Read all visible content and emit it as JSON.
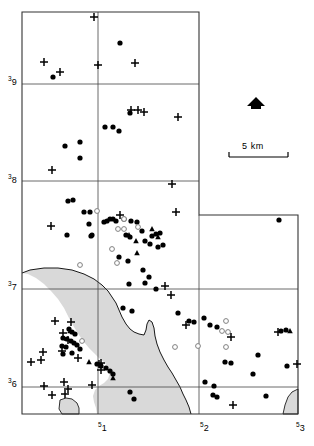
{
  "figure": {
    "type": "distribution-map",
    "width": 314,
    "height": 446,
    "background_color": "#ffffff",
    "line_color": "#000000",
    "shaded_area_color": "#d9d9d9"
  },
  "axes": {
    "x_labels": [
      {
        "text": "51",
        "sup": "5",
        "base": "1",
        "x": 98,
        "y": 424
      },
      {
        "text": "52",
        "sup": "5",
        "base": "2",
        "x": 200,
        "y": 424
      },
      {
        "text": "53",
        "sup": "5",
        "base": "3",
        "x": 296,
        "y": 424
      }
    ],
    "y_labels": [
      {
        "text": "39",
        "sup": "3",
        "base": "9",
        "x": 8,
        "y": 78
      },
      {
        "text": "38",
        "sup": "3",
        "base": "8",
        "x": 8,
        "y": 176
      },
      {
        "text": "37",
        "sup": "3",
        "base": "7",
        "x": 8,
        "y": 283
      },
      {
        "text": "36",
        "sup": "3",
        "base": "6",
        "x": 8,
        "y": 380
      }
    ]
  },
  "scale_bar": {
    "label": "5 km",
    "label_x": 242,
    "label_y": 141,
    "line_x1": 229,
    "line_x2": 288,
    "line_y": 157,
    "tick_height": 5
  },
  "north_arrow": {
    "name": "north-arrow",
    "cx": 256,
    "cy": 104
  },
  "frame": {
    "outer_path": "M22,12 L199,12 L199,215 L298,215 L298,414 L22,414 Z",
    "grid_lines": [
      {
        "orientation": "vertical",
        "x": 98,
        "y1": 12,
        "y2": 414
      },
      {
        "orientation": "horizontal",
        "y": 84,
        "x1": 22,
        "x2": 199
      },
      {
        "orientation": "horizontal",
        "y": 181,
        "x1": 22,
        "x2": 199
      },
      {
        "orientation": "horizontal",
        "y": 289,
        "x1": 22,
        "x2": 298
      },
      {
        "orientation": "horizontal",
        "y": 387,
        "x1": 22,
        "x2": 298
      },
      {
        "orientation": "vertical",
        "x": 199,
        "y1": 215,
        "y2": 414
      }
    ]
  },
  "shaded_region": {
    "name": "shaded-landform-region",
    "outline_path": "M22,273 L30,270 L44,268 L58,268 L72,270 L84,274 L94,279 L102,285 L108,291 L112,297 L116,303 L119,310 L122,317 L126,324 L130,329 L134,332 L139,334 L144,335 L146,330 L147,324 L149,320 L152,322 L154,328 L155,336 L157,344 L160,352 L164,360 L168,367 L172,373 L176,380 L180,387 L183,394 L186,400 L189,407 L191,414 L97,414 L96,408 L94,402 L93,396 L95,390 L99,386 L104,383 L108,379 L110,373 L108,367 L104,362 L99,358 L94,353 L89,348 L84,342 L79,335 L74,327 L69,318 L64,308 L58,299 L51,291 L44,284 L36,278 L28,274 Z"
  },
  "coastline": {
    "name": "coastline-path",
    "path": "M22,273 L30,270 L44,268 L58,268 L72,270 L84,274 L94,279 L102,285 L108,291 L112,297 L116,303 L119,310 L122,317 L126,324 L130,329 L134,332 L139,334 L144,335 L146,330 L147,324 L149,320 L152,322 L154,328 L155,336 L157,344 L160,352 L164,360 L168,367 L172,373 L176,380 L180,387 L183,394 L186,400 L189,407 L191,414"
  },
  "inlet_shape": {
    "name": "small-inlet-shape",
    "path": "M60,400 L66,398 L72,399 L77,403 L79,408 L79,414 L62,414 L59,409 Z"
  },
  "corner_shape": {
    "name": "bottom-right-corner-landform",
    "path": "M283,414 L285,405 L288,397 L292,392 L298,389 L298,414 Z"
  },
  "legend_symbols": {
    "filled_circle": "filled-circle-marker",
    "open_circle": "open-circle-marker",
    "filled_triangle": "filled-triangle-marker",
    "plus": "plus-marker"
  },
  "chart_data": {
    "type": "scatter",
    "title": "",
    "xlabel": "",
    "ylabel": "",
    "xlim": [
      22,
      298
    ],
    "ylim": [
      12,
      414
    ],
    "grid": true,
    "series": [
      {
        "name": "filled-circle",
        "symbol": "filled_circle",
        "color": "#000000",
        "points": [
          [
            120,
            43
          ],
          [
            53,
            77
          ],
          [
            130,
            113
          ],
          [
            105,
            127
          ],
          [
            113,
            127
          ],
          [
            119,
            131
          ],
          [
            65,
            146
          ],
          [
            80,
            142
          ],
          [
            80,
            158
          ],
          [
            68,
            201
          ],
          [
            73,
            200
          ],
          [
            84,
            212
          ],
          [
            90,
            212
          ],
          [
            89,
            224
          ],
          [
            92,
            235
          ],
          [
            67,
            235
          ],
          [
            91,
            236
          ],
          [
            104,
            222
          ],
          [
            107,
            221
          ],
          [
            110,
            219
          ],
          [
            113,
            219
          ],
          [
            116,
            221
          ],
          [
            124,
            219
          ],
          [
            131,
            221
          ],
          [
            137,
            222
          ],
          [
            126,
            235
          ],
          [
            130,
            237
          ],
          [
            142,
            231
          ],
          [
            152,
            236
          ],
          [
            156,
            234
          ],
          [
            160,
            233
          ],
          [
            145,
            241
          ],
          [
            150,
            244
          ],
          [
            158,
            247
          ],
          [
            163,
            245
          ],
          [
            119,
            257
          ],
          [
            128,
            261
          ],
          [
            143,
            270
          ],
          [
            149,
            277
          ],
          [
            129,
            284
          ],
          [
            145,
            283
          ],
          [
            156,
            289
          ],
          [
            123,
            308
          ],
          [
            132,
            311
          ],
          [
            178,
            313
          ],
          [
            189,
            321
          ],
          [
            194,
            322
          ],
          [
            204,
            318
          ],
          [
            210,
            325
          ],
          [
            217,
            327
          ],
          [
            279,
            220
          ],
          [
            281,
            331
          ],
          [
            286,
            330
          ],
          [
            69,
            329
          ],
          [
            72,
            332
          ],
          [
            75,
            334
          ],
          [
            63,
            338
          ],
          [
            67,
            339
          ],
          [
            71,
            341
          ],
          [
            74,
            343
          ],
          [
            77,
            345
          ],
          [
            62,
            346
          ],
          [
            66,
            347
          ],
          [
            80,
            349
          ],
          [
            72,
            353
          ],
          [
            63,
            354
          ],
          [
            97,
            364
          ],
          [
            101,
            366
          ],
          [
            106,
            368
          ],
          [
            110,
            371
          ],
          [
            113,
            374
          ],
          [
            225,
            362
          ],
          [
            231,
            363
          ],
          [
            258,
            355
          ],
          [
            253,
            374
          ],
          [
            287,
            366
          ],
          [
            205,
            382
          ],
          [
            214,
            386
          ],
          [
            213,
            395
          ],
          [
            217,
            397
          ],
          [
            266,
            396
          ],
          [
            130,
            392
          ],
          [
            134,
            399
          ]
        ]
      },
      {
        "name": "open-circle",
        "symbol": "open_circle",
        "color": "#808080",
        "points": [
          [
            97,
            211
          ],
          [
            124,
            219
          ],
          [
            118,
            229
          ],
          [
            124,
            229
          ],
          [
            138,
            227
          ],
          [
            112,
            249
          ],
          [
            80,
            265
          ],
          [
            117,
            263
          ],
          [
            82,
            341
          ],
          [
            226,
            321
          ],
          [
            222,
            331
          ],
          [
            228,
            332
          ],
          [
            175,
            347
          ],
          [
            198,
            346
          ],
          [
            226,
            347
          ]
        ]
      },
      {
        "name": "filled-triangle",
        "symbol": "filled_triangle",
        "color": "#000000",
        "points": [
          [
            129,
            235
          ],
          [
            152,
            229
          ],
          [
            136,
            241
          ],
          [
            137,
            253
          ],
          [
            158,
            237
          ],
          [
            290,
            331
          ],
          [
            89,
            362
          ],
          [
            113,
            378
          ],
          [
            70,
            331
          ]
        ]
      },
      {
        "name": "plus",
        "symbol": "plus",
        "color": "#000000",
        "points": [
          [
            94,
            17
          ],
          [
            44,
            62
          ],
          [
            60,
            72
          ],
          [
            98,
            65
          ],
          [
            135,
            63
          ],
          [
            131,
            110
          ],
          [
            138,
            110
          ],
          [
            144,
            112
          ],
          [
            178,
            117
          ],
          [
            52,
            170
          ],
          [
            172,
            184
          ],
          [
            51,
            226
          ],
          [
            120,
            215
          ],
          [
            176,
            212
          ],
          [
            165,
            286
          ],
          [
            171,
            295
          ],
          [
            55,
            321
          ],
          [
            71,
            322
          ],
          [
            63,
            333
          ],
          [
            68,
            340
          ],
          [
            43,
            352
          ],
          [
            62,
            351
          ],
          [
            78,
            358
          ],
          [
            31,
            362
          ],
          [
            41,
            360
          ],
          [
            99,
            364
          ],
          [
            101,
            370
          ],
          [
            186,
            325
          ],
          [
            231,
            337
          ],
          [
            278,
            332
          ],
          [
            297,
            364
          ],
          [
            44,
            386
          ],
          [
            64,
            382
          ],
          [
            68,
            389
          ],
          [
            92,
            385
          ],
          [
            52,
            395
          ],
          [
            65,
            394
          ],
          [
            233,
            405
          ],
          [
            101,
            363
          ]
        ]
      }
    ]
  }
}
